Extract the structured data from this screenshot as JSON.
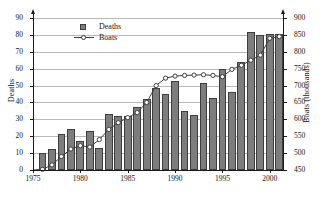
{
  "chart_data": {
    "type": "bar",
    "title": "",
    "subtitle": "",
    "xlabel": "",
    "ylabel": "Deaths",
    "y2label": "Boats (thousands)",
    "grid": true,
    "legend_position": "top-left-inside",
    "ylim": [
      0,
      90
    ],
    "y2lim": [
      450,
      900
    ],
    "xlim": [
      1975,
      2001.5
    ],
    "yticks": [
      0,
      10,
      20,
      30,
      40,
      50,
      60,
      70,
      80,
      90
    ],
    "y2ticks": [
      450,
      500,
      550,
      600,
      650,
      700,
      750,
      800,
      850,
      900
    ],
    "xticks": [
      1975,
      1980,
      1985,
      1990,
      1995,
      2000
    ],
    "xticklabels": [
      "1975",
      "1980",
      "1985",
      "1990",
      "1995",
      "2000"
    ],
    "categories": [
      1976,
      1977,
      1978,
      1979,
      1980,
      1981,
      1982,
      1983,
      1984,
      1985,
      1986,
      1987,
      1988,
      1989,
      1990,
      1991,
      1992,
      1993,
      1994,
      1995,
      1996,
      1997,
      1998,
      1999,
      2000,
      2001
    ],
    "series": [
      {
        "name": "Deaths",
        "type": "bar",
        "axis": "left",
        "color": "#7d7d7d",
        "values": [
          10,
          12.5,
          21.5,
          24.5,
          17,
          23,
          13,
          33,
          32,
          32,
          37.5,
          42,
          48.5,
          45,
          52.5,
          35,
          32.5,
          51.5,
          42.5,
          60,
          46,
          64,
          81.5,
          80,
          80.5,
          80.5
        ]
      },
      {
        "name": "Boats",
        "type": "line",
        "axis": "right",
        "color": "#3d3d3d",
        "marker": "open-circle",
        "values": [
          452,
          465,
          490,
          512,
          522,
          518,
          540,
          570,
          590,
          605,
          620,
          650,
          700,
          722,
          728,
          730,
          731,
          732,
          730,
          726,
          748,
          760,
          775,
          790,
          840,
          845
        ]
      }
    ],
    "legend": [
      {
        "label": "Deaths",
        "key": "filled-square",
        "color": "#7d7d7d"
      },
      {
        "label": "Boats",
        "key": "line-open-circle",
        "color": "#3d3d3d"
      }
    ]
  }
}
